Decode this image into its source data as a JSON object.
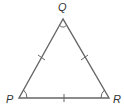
{
  "diagram": {
    "type": "equilateral-triangle",
    "vertices": [
      {
        "name": "Q",
        "x": 63,
        "y": 19,
        "label_x": 58,
        "label_y": 11
      },
      {
        "name": "P",
        "x": 19,
        "y": 98,
        "label_x": 6,
        "label_y": 103
      },
      {
        "name": "R",
        "x": 109,
        "y": 98,
        "label_x": 113,
        "label_y": 103
      }
    ],
    "labels": {
      "Q": "Q",
      "P": "P",
      "R": "R"
    },
    "side_marks": "single tick on each side (congruent sides)",
    "angle_marks": "single arc at each vertex (congruent angles)",
    "stroke_color": "#666666",
    "label_color": "#333333"
  }
}
